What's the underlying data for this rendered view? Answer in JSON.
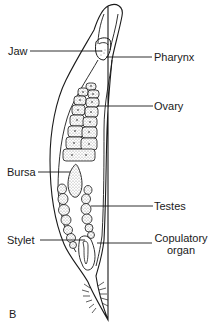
{
  "figure": {
    "panel_letter": "B",
    "labels": {
      "jaw": "Jaw",
      "pharynx": "Pharynx",
      "ovary": "Ovary",
      "bursa": "Bursa",
      "testes": "Testes",
      "stylet": "Stylet",
      "copulatory_organ_line1": "Copulatory",
      "copulatory_organ_line2": "organ"
    }
  },
  "colors": {
    "line": "#1a1a1a",
    "stipple": "#9a9a9a",
    "background": "#ffffff"
  }
}
